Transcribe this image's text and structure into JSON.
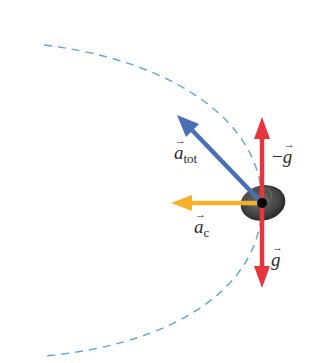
{
  "diagram": {
    "path": {
      "style": "dashed",
      "color": "#5aa7d6"
    },
    "object": {
      "shape": "ellipse",
      "color": "#4a4a4a",
      "center_dot_color": "#000000"
    },
    "vectors": [
      {
        "id": "a_tot",
        "symbol": "a",
        "subscript": "tot",
        "color": "#4b6fb5",
        "direction": "up-left"
      },
      {
        "id": "a_c",
        "symbol": "a",
        "subscript": "c",
        "color": "#f5b12a",
        "direction": "left"
      },
      {
        "id": "neg_g",
        "symbol": "g",
        "prefix": "−",
        "color": "#e8343c",
        "direction": "up"
      },
      {
        "id": "g",
        "symbol": "g",
        "color": "#e8343c",
        "direction": "down"
      }
    ]
  },
  "labels": {
    "a_tot_symbol": "a",
    "a_tot_sub": "tot",
    "a_c_symbol": "a",
    "a_c_sub": "c",
    "neg_g_prefix": "−",
    "neg_g_symbol": "g",
    "g_symbol": "g"
  }
}
